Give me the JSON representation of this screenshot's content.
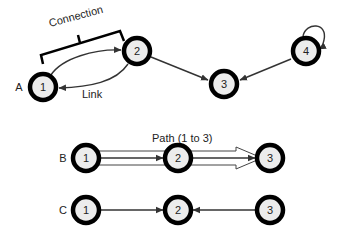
{
  "diagram": {
    "type": "network-graph-concepts",
    "graph_a": {
      "row_label": "A",
      "nodes": [
        {
          "id": "1",
          "label": "1",
          "x": 43,
          "y": 87
        },
        {
          "id": "2",
          "label": "2",
          "x": 137,
          "y": 51
        },
        {
          "id": "3",
          "label": "3",
          "x": 224,
          "y": 84
        },
        {
          "id": "4",
          "label": "4",
          "x": 306,
          "y": 51
        }
      ],
      "edges": [
        {
          "from": "1",
          "to": "2",
          "style": "curved-upper"
        },
        {
          "from": "2",
          "to": "1",
          "style": "curved-lower"
        },
        {
          "from": "2",
          "to": "3",
          "style": "straight"
        },
        {
          "from": "4",
          "to": "3",
          "style": "straight"
        },
        {
          "from": "4",
          "to": "4",
          "style": "self-loop"
        }
      ],
      "annotations": {
        "connection_label": "Connection",
        "link_label": "Link"
      }
    },
    "graph_b": {
      "row_label": "B",
      "nodes": [
        {
          "id": "1",
          "label": "1",
          "x": 86,
          "y": 158
        },
        {
          "id": "2",
          "label": "2",
          "x": 178,
          "y": 158
        },
        {
          "id": "3",
          "label": "3",
          "x": 270,
          "y": 158
        }
      ],
      "edges": [
        {
          "from": "1",
          "to": "2"
        },
        {
          "from": "2",
          "to": "3"
        }
      ],
      "path_label": "Path (1 to 3)"
    },
    "graph_c": {
      "row_label": "C",
      "nodes": [
        {
          "id": "1",
          "label": "1",
          "x": 86,
          "y": 210
        },
        {
          "id": "2",
          "label": "2",
          "x": 178,
          "y": 210
        },
        {
          "id": "3",
          "label": "3",
          "x": 270,
          "y": 210
        }
      ],
      "edges": [
        {
          "from": "1",
          "to": "2"
        },
        {
          "from": "3",
          "to": "2"
        }
      ]
    }
  }
}
